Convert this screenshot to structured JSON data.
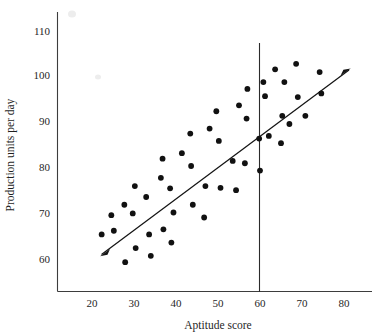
{
  "chart_data": {
    "type": "scatter",
    "title": "",
    "subtitle": "",
    "xlabel": "Aptitude score",
    "ylabel": "Production units per day",
    "xlim": [
      14,
      85
    ],
    "ylim": [
      54,
      113
    ],
    "xticks": [
      20,
      30,
      40,
      50,
      60,
      70,
      80
    ],
    "yticks": [
      60,
      70,
      80,
      90,
      100,
      110
    ],
    "xtick_labels": [
      "20",
      "30",
      "40",
      "50",
      "60",
      "70",
      "80"
    ],
    "ytick_labels": [
      "60",
      "70",
      "80",
      "90",
      "100",
      "110"
    ],
    "grid": false,
    "legend": null,
    "series": [
      {
        "name": "observations",
        "marker": "filled-circle",
        "color": "#111111",
        "points": [
          [
            22.3,
            65.4
          ],
          [
            24.6,
            69.6
          ],
          [
            25.2,
            66.2
          ],
          [
            27.7,
            71.9
          ],
          [
            27.9,
            59.3
          ],
          [
            29.7,
            70.0
          ],
          [
            30.2,
            76.0
          ],
          [
            30.4,
            62.4
          ],
          [
            32.9,
            73.6
          ],
          [
            33.6,
            65.4
          ],
          [
            34.0,
            60.7
          ],
          [
            36.4,
            77.8
          ],
          [
            36.8,
            82.0
          ],
          [
            37.0,
            66.5
          ],
          [
            38.6,
            75.5
          ],
          [
            38.9,
            63.6
          ],
          [
            39.4,
            70.2
          ],
          [
            41.4,
            83.2
          ],
          [
            43.4,
            87.5
          ],
          [
            43.6,
            80.4
          ],
          [
            44.0,
            71.9
          ],
          [
            46.7,
            69.1
          ],
          [
            47.0,
            76.0
          ],
          [
            48.0,
            88.6
          ],
          [
            49.6,
            92.4
          ],
          [
            50.2,
            85.9
          ],
          [
            50.6,
            75.6
          ],
          [
            53.5,
            81.5
          ],
          [
            54.3,
            75.1
          ],
          [
            55.0,
            93.7
          ],
          [
            56.4,
            81.0
          ],
          [
            56.8,
            90.8
          ],
          [
            57.0,
            97.3
          ],
          [
            59.8,
            86.4
          ],
          [
            60.0,
            79.4
          ],
          [
            60.8,
            98.8
          ],
          [
            61.2,
            95.7
          ],
          [
            62.1,
            87.0
          ],
          [
            63.6,
            101.6
          ],
          [
            65.0,
            85.4
          ],
          [
            65.3,
            91.4
          ],
          [
            65.8,
            98.8
          ],
          [
            67.0,
            89.6
          ],
          [
            68.6,
            102.8
          ],
          [
            69.0,
            95.5
          ],
          [
            70.8,
            91.4
          ],
          [
            74.2,
            101.0
          ],
          [
            74.6,
            96.3
          ]
        ]
      }
    ],
    "fit_line": {
      "name": "regression-line",
      "style": "double-headed-arrow",
      "start": [
        22.0,
        60.1
      ],
      "end": [
        76.4,
        102.0
      ],
      "color": "#141414"
    },
    "reference_line": {
      "name": "vertical-divider",
      "orientation": "vertical",
      "x": 60,
      "y_from": 54.5,
      "y_to": 108.4,
      "color": "#2b2b2b"
    }
  },
  "axis": {
    "x_title": "Aptitude score",
    "y_title": "Production units per day"
  }
}
